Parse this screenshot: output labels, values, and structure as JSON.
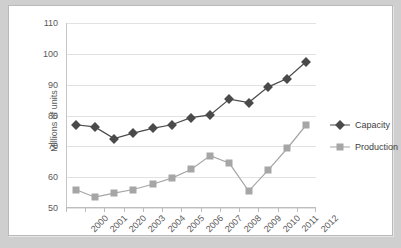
{
  "chart_data": {
    "type": "line",
    "title": "",
    "xlabel": "",
    "ylabel": "Millions of units",
    "ylim": [
      50,
      110
    ],
    "ytick_step": 10,
    "yticks": [
      "110",
      "100",
      "90",
      "80",
      "70",
      "60",
      "50"
    ],
    "grid": true,
    "legend_position": "right",
    "categories": [
      "2000",
      "2001",
      "2020",
      "2003",
      "2004",
      "2005",
      "2006",
      "2007",
      "2008",
      "2009",
      "2010",
      "2011",
      "2012"
    ],
    "series": [
      {
        "name": "Capacity",
        "color": "#4a4a4a",
        "marker": "diamond",
        "values": [
          77.0,
          76.3,
          72.5,
          74.3,
          75.8,
          77.0,
          79.3,
          80.2,
          85.3,
          84.2,
          89.2,
          92.0,
          97.5
        ]
      },
      {
        "name": "Production",
        "color": "#a6a6a6",
        "marker": "square",
        "values": [
          56.0,
          53.5,
          54.8,
          56.0,
          57.7,
          59.7,
          62.5,
          67.0,
          64.5,
          55.5,
          62.2,
          69.3,
          77.0
        ]
      }
    ]
  },
  "legend": {
    "entries": [
      {
        "label": "Capacity"
      },
      {
        "label": "Production"
      }
    ]
  },
  "axis": {
    "y_title": "Millions of units"
  }
}
